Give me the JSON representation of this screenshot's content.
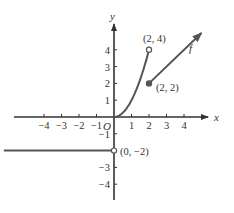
{
  "chart_data": {
    "type": "line",
    "title": "",
    "xlabel": "x",
    "ylabel": "y",
    "origin_label": "O",
    "function_label": "f",
    "xlim": [
      -6.3,
      5.5
    ],
    "ylim": [
      -5.2,
      6.8
    ],
    "grid": false,
    "x_ticks": [
      -4,
      -3,
      -2,
      -1,
      1,
      2,
      3,
      4
    ],
    "x_tick_labels": [
      "−4",
      "−3",
      "−2",
      "−1",
      "1",
      "2",
      "3",
      "4"
    ],
    "y_ticks": [
      4,
      3,
      2,
      1,
      -1,
      -2,
      -3,
      -4
    ],
    "y_tick_labels": [
      "4",
      "3",
      "2",
      "1",
      "−1",
      "",
      "−3",
      "−4"
    ],
    "series": [
      {
        "name": "constant piece",
        "description": "f(x) = -2 for x < 0",
        "points": [
          [
            -6.3,
            -2
          ],
          [
            0,
            -2
          ]
        ],
        "end": "open"
      },
      {
        "name": "quadratic piece",
        "description": "f(x) = x^2 for 0 <= x < 2",
        "points": [
          [
            0,
            0
          ],
          [
            0.5,
            0.25
          ],
          [
            1,
            1
          ],
          [
            1.5,
            2.25
          ],
          [
            2,
            4
          ]
        ],
        "end": "open"
      },
      {
        "name": "linear piece",
        "description": "f(x) = x for x >= 2 (arrow continues)",
        "points": [
          [
            2,
            2
          ],
          [
            5,
            5
          ]
        ],
        "start": "closed",
        "end": "arrow"
      }
    ],
    "annotations": [
      {
        "text": "(2, 4)",
        "x": 2,
        "y": 4,
        "marker": "open-circle"
      },
      {
        "text": "(2, 2)",
        "x": 2,
        "y": 2,
        "marker": "filled-circle"
      },
      {
        "text": "(0, −2)",
        "x": 0,
        "y": -2,
        "marker": "open-circle"
      }
    ],
    "legend": null
  },
  "colors": {
    "axis": "#333333",
    "curve": "#555555",
    "background": "#ffffff"
  }
}
